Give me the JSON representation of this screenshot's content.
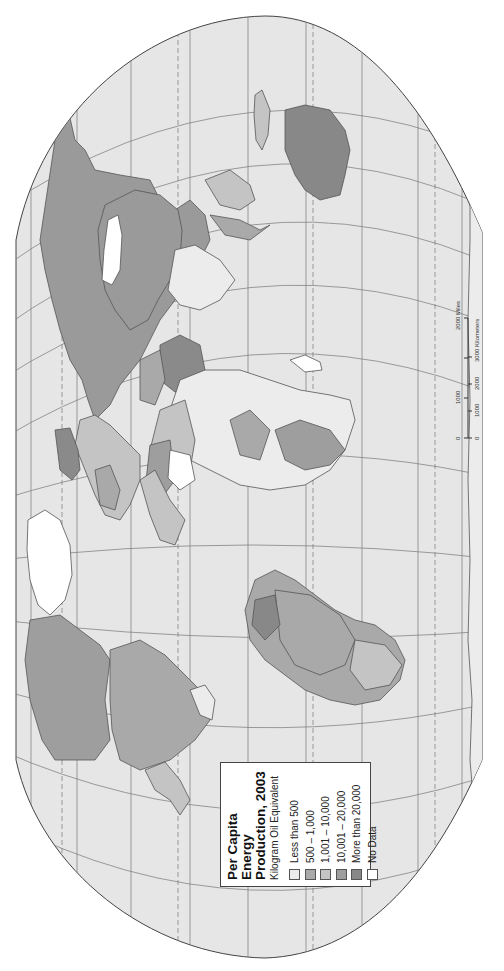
{
  "legend": {
    "title_line1": "Per Capita Energy",
    "title_line2": "Production, 2003",
    "subtitle": "Kilogram Oil Equivalent",
    "items": [
      {
        "label": "Less than 500",
        "color": "#ececec"
      },
      {
        "label": "500 – 1,000",
        "color": "#a9a9a9"
      },
      {
        "label": "1,001 – 10,000",
        "color": "#c4c4c4"
      },
      {
        "label": "10,001 – 20,000",
        "color": "#9e9e9e"
      },
      {
        "label": "More than 20,000",
        "color": "#888888"
      },
      {
        "label": "No Data",
        "color": "#ffffff"
      }
    ]
  },
  "scale_bar": {
    "miles_ticks": [
      "0",
      "1000",
      "2000 Miles"
    ],
    "km_ticks": [
      "0",
      "1000",
      "2000",
      "3000 Kilometers"
    ]
  },
  "colors": {
    "ocean": "#e6e6e6",
    "background": "#ffffff",
    "graticule": "#777777",
    "border": "#555555"
  }
}
